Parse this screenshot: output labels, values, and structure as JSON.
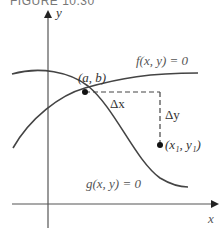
{
  "figure": {
    "caption": "FIGURE 10.30"
  },
  "axes": {
    "x_label": "x",
    "y_label": "y"
  },
  "curves": {
    "f_label": "f(x, y) = 0",
    "g_label": "g(x, y) = 0"
  },
  "points": {
    "intersection_label": "(a, b)",
    "initial_label": "(x₁, y₁)"
  },
  "increments": {
    "dx_label": "Δx",
    "dy_label": "Δy"
  },
  "colors": {
    "curve": "#444444",
    "axis": "#555555",
    "point": "#111111",
    "text": "#555555"
  }
}
